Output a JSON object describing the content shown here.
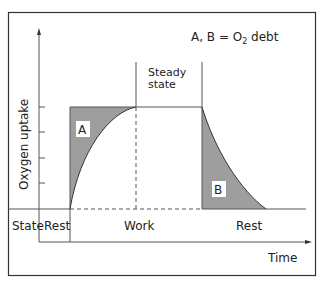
{
  "legend": {
    "prefix": "A, B = O",
    "subscript": "2",
    "suffix": " debt"
  },
  "y_axis_label": "Oxygen uptake",
  "x_axis_label": "Time",
  "steady_state": {
    "line1": "Steady",
    "line2": "state"
  },
  "regions": {
    "a": "A",
    "b": "B"
  },
  "state_row": {
    "label": "State",
    "phases": [
      "Rest",
      "Work",
      "Rest"
    ]
  },
  "colors": {
    "shade": "#9e9e9e",
    "line": "#333333",
    "frame": "#333333"
  }
}
